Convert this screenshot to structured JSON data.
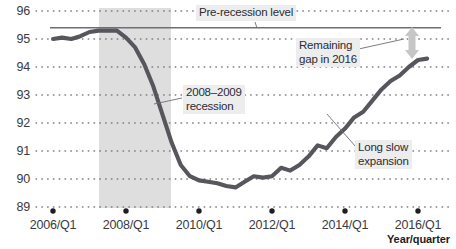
{
  "chart_data": {
    "type": "line",
    "title": "",
    "xlabel": "Year/quarter",
    "ylabel": "",
    "ylim": [
      89,
      96
    ],
    "yticks": [
      89,
      90,
      91,
      92,
      93,
      94,
      95,
      96
    ],
    "xticks": [
      "2006/Q1",
      "2008/Q1",
      "2010/Q1",
      "2012/Q1",
      "2014/Q1",
      "2016/Q1"
    ],
    "grid": "dotted-horizontal",
    "legend": "none",
    "series": [
      {
        "name": "Index",
        "x": [
          "2006/Q1",
          "2006/Q2",
          "2006/Q3",
          "2006/Q4",
          "2007/Q1",
          "2007/Q2",
          "2007/Q3",
          "2007/Q4",
          "2008/Q1",
          "2008/Q2",
          "2008/Q3",
          "2008/Q4",
          "2009/Q1",
          "2009/Q2",
          "2009/Q3",
          "2009/Q4",
          "2010/Q1",
          "2010/Q2",
          "2010/Q3",
          "2010/Q4",
          "2011/Q1",
          "2011/Q2",
          "2011/Q3",
          "2011/Q4",
          "2012/Q1",
          "2012/Q2",
          "2012/Q3",
          "2012/Q4",
          "2013/Q1",
          "2013/Q2",
          "2013/Q3",
          "2013/Q4",
          "2014/Q1",
          "2014/Q2",
          "2014/Q3",
          "2014/Q4",
          "2015/Q1",
          "2015/Q2",
          "2015/Q3",
          "2015/Q4",
          "2016/Q1",
          "2016/Q2"
        ],
        "values": [
          95.0,
          95.05,
          95.0,
          95.1,
          95.25,
          95.3,
          95.3,
          95.3,
          95.05,
          94.7,
          94.1,
          93.3,
          92.3,
          91.3,
          90.5,
          90.1,
          89.95,
          89.9,
          89.85,
          89.75,
          89.7,
          89.9,
          90.1,
          90.05,
          90.1,
          90.4,
          90.3,
          90.5,
          90.8,
          91.2,
          91.1,
          91.5,
          91.8,
          92.2,
          92.4,
          92.8,
          93.2,
          93.5,
          93.7,
          94.0,
          94.25,
          94.3
        ]
      }
    ],
    "reference_line": {
      "label": "Pre-recession level",
      "value": 95.4,
      "x_start": "2006/Q1",
      "x_end": "2016/Q2"
    },
    "shaded_region": {
      "label": "2008-2009 recession",
      "x_start": "2007/Q4",
      "x_end": "2009/Q2"
    },
    "annotations": [
      {
        "name": "pre-recession-level",
        "text": "Pre-recession level"
      },
      {
        "name": "recession-band",
        "text": "2008–2009\nrecession"
      },
      {
        "name": "remaining-gap",
        "text": "Remaining\ngap in 2016"
      },
      {
        "name": "long-slow-expansion",
        "text": "Long slow\nexpansion"
      }
    ]
  },
  "axes": {
    "x_title": "Year/quarter",
    "y_ticks": [
      "96",
      "95",
      "94",
      "93",
      "92",
      "91",
      "90",
      "89"
    ],
    "x_ticks": [
      "2006/Q1",
      "2008/Q1",
      "2010/Q1",
      "2012/Q1",
      "2014/Q1",
      "2016/Q1"
    ]
  },
  "annotations": {
    "pre_recession": "Pre-recession level",
    "recession": "2008–2009\nrecession",
    "remaining_gap": "Remaining\ngap in 2016",
    "expansion": "Long slow\nexpansion"
  },
  "colors": {
    "line": "#56565c",
    "reference_line": "#6e6e76",
    "shading": "#dedede",
    "grid_dot": "#7a7a82",
    "gap_arrow": "#c6c6c6",
    "text": "#2b2b33",
    "note_bg": "#ededed"
  }
}
